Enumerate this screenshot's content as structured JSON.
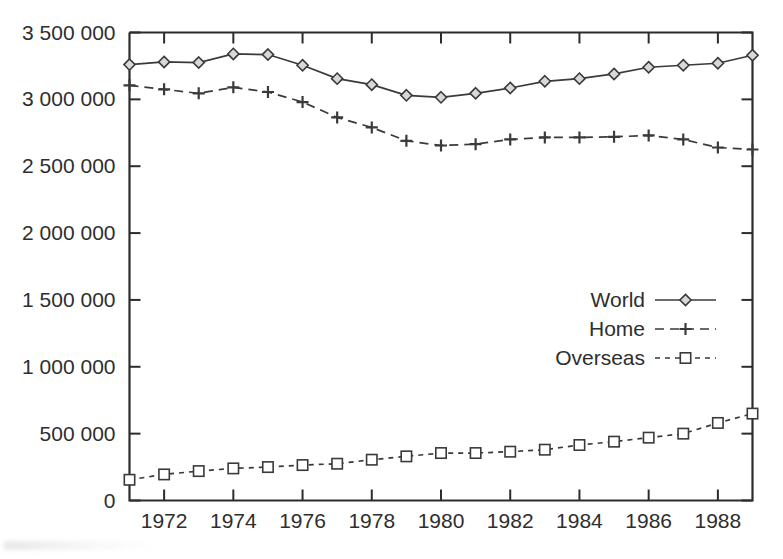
{
  "chart_data": {
    "type": "line",
    "title": "",
    "subtitle": "",
    "xlabel": "",
    "ylabel": "",
    "x": [
      1971,
      1972,
      1973,
      1974,
      1975,
      1976,
      1977,
      1978,
      1979,
      1980,
      1981,
      1982,
      1983,
      1984,
      1985,
      1986,
      1987,
      1988,
      1989
    ],
    "xlim": [
      1971,
      1989
    ],
    "ylim": [
      0,
      3500000
    ],
    "grid": false,
    "legend_position": "center-right",
    "xtick_labels": [
      "1972",
      "1974",
      "1976",
      "1978",
      "1980",
      "1982",
      "1984",
      "1986",
      "1988"
    ],
    "xtick_values": [
      1972,
      1974,
      1976,
      1978,
      1980,
      1982,
      1984,
      1986,
      1988
    ],
    "ytick_labels": [
      "0",
      "500 000",
      "1 000 000",
      "1 500 000",
      "2 000 000",
      "2 500 000",
      "3 000 000",
      "3 500 000"
    ],
    "ytick_values": [
      0,
      500000,
      1000000,
      1500000,
      2000000,
      2500000,
      3000000,
      3500000
    ],
    "series": [
      {
        "name": "World",
        "linestyle": "solid",
        "marker": "diamond",
        "color": "#3a3a3a",
        "values": [
          3260000,
          3280000,
          3275000,
          3340000,
          3335000,
          3255000,
          3155000,
          3110000,
          3030000,
          3015000,
          3045000,
          3085000,
          3135000,
          3155000,
          3190000,
          3240000,
          3255000,
          3270000,
          3330000
        ]
      },
      {
        "name": "Home",
        "linestyle": "dashed",
        "marker": "plus",
        "color": "#3a3a3a",
        "values": [
          3105000,
          3075000,
          3045000,
          3090000,
          3055000,
          2980000,
          2865000,
          2790000,
          2690000,
          2655000,
          2665000,
          2700000,
          2715000,
          2715000,
          2720000,
          2730000,
          2700000,
          2640000,
          2625000
        ]
      },
      {
        "name": "Overseas",
        "linestyle": "dotted-dashed",
        "marker": "square",
        "color": "#3a3a3a",
        "values": [
          155000,
          195000,
          220000,
          240000,
          250000,
          265000,
          275000,
          305000,
          330000,
          355000,
          355000,
          365000,
          380000,
          415000,
          440000,
          470000,
          500000,
          580000,
          650000
        ]
      }
    ]
  },
  "legend": {
    "items": [
      {
        "label": "World"
      },
      {
        "label": "Home"
      },
      {
        "label": "Overseas"
      }
    ]
  },
  "axes": {
    "y_axis_name": "value-axis",
    "x_axis_name": "year-axis"
  }
}
